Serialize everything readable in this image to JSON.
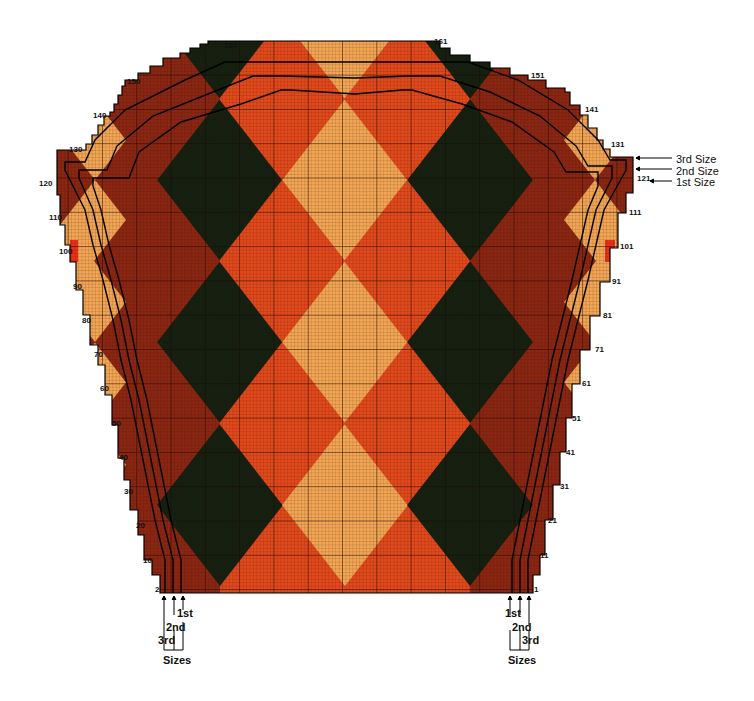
{
  "chart": {
    "colors": {
      "light_orange": "#f2a654",
      "orange_red": "#e2491b",
      "brick": "#8b2612",
      "dark_green": "#142010",
      "bright_red": "#e8301a",
      "grid": "#2a0c04",
      "outline": "#000000"
    },
    "grid": {
      "left": 55,
      "right": 633,
      "top": 41,
      "bottom": 593,
      "rows": 161,
      "cell": 3.43
    },
    "diamonds": {
      "half_width": 63,
      "half_height": 81,
      "columns": [
        {
          "cx": 220,
          "type": "dark"
        },
        {
          "cx": 345,
          "type": "light"
        },
        {
          "cx": 470,
          "type": "dark"
        }
      ],
      "row_centers": [
        505,
        342,
        180,
        18
      ]
    }
  },
  "row_labels_left": [
    {
      "text": "160",
      "x": 224,
      "y": 46
    },
    {
      "text": "150",
      "x": 127,
      "y": 82
    },
    {
      "text": "140",
      "x": 93,
      "y": 116
    },
    {
      "text": "130",
      "x": 69,
      "y": 150
    },
    {
      "text": "120",
      "x": 39,
      "y": 184
    },
    {
      "text": "110",
      "x": 49,
      "y": 218
    },
    {
      "text": "100",
      "x": 59,
      "y": 252
    },
    {
      "text": "90",
      "x": 73,
      "y": 287
    },
    {
      "text": "80",
      "x": 82,
      "y": 321
    },
    {
      "text": "70",
      "x": 94,
      "y": 355
    },
    {
      "text": "60",
      "x": 100,
      "y": 389
    },
    {
      "text": "50",
      "x": 112,
      "y": 424
    },
    {
      "text": "40",
      "x": 119,
      "y": 458
    },
    {
      "text": "30",
      "x": 124,
      "y": 492
    },
    {
      "text": "20",
      "x": 136,
      "y": 526
    },
    {
      "text": "10",
      "x": 143,
      "y": 561
    },
    {
      "text": "2",
      "x": 155,
      "y": 590
    }
  ],
  "row_labels_right": [
    {
      "text": "161",
      "x": 434,
      "y": 42
    },
    {
      "text": "151",
      "x": 531,
      "y": 76
    },
    {
      "text": "141",
      "x": 585,
      "y": 110
    },
    {
      "text": "131",
      "x": 611,
      "y": 145
    },
    {
      "text": "121",
      "x": 637,
      "y": 179
    },
    {
      "text": "111",
      "x": 629,
      "y": 213
    },
    {
      "text": "101",
      "x": 620,
      "y": 247
    },
    {
      "text": "91",
      "x": 612,
      "y": 282
    },
    {
      "text": "81",
      "x": 603,
      "y": 316
    },
    {
      "text": "71",
      "x": 595,
      "y": 350
    },
    {
      "text": "61",
      "x": 582,
      "y": 384
    },
    {
      "text": "51",
      "x": 572,
      "y": 419
    },
    {
      "text": "41",
      "x": 566,
      "y": 453
    },
    {
      "text": "31",
      "x": 560,
      "y": 487
    },
    {
      "text": "21",
      "x": 548,
      "y": 521
    },
    {
      "text": "11",
      "x": 540,
      "y": 556
    },
    {
      "text": "1",
      "x": 534,
      "y": 590
    }
  ],
  "size_key": {
    "third": "3rd  Size",
    "second": "2nd  Size",
    "first": "1st  Size"
  },
  "bottom_left_sizes": {
    "first": "1st",
    "second": "2nd",
    "third": "3rd",
    "caption": "Sizes"
  },
  "bottom_right_sizes": {
    "first": "1st",
    "second": "2nd",
    "third": "3rd",
    "caption": "Sizes"
  }
}
